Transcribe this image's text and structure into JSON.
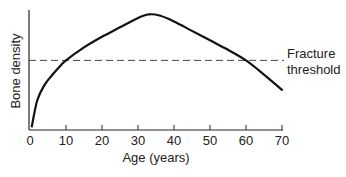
{
  "chart_data": {
    "type": "line",
    "title": "",
    "xlabel": "Age (years)",
    "ylabel": "Bone density",
    "xlim": [
      0,
      70
    ],
    "ylim": [
      0,
      100
    ],
    "x_ticks": [
      0,
      10,
      20,
      30,
      40,
      50,
      60,
      70
    ],
    "y_ticks": [],
    "grid": false,
    "series": [
      {
        "name": "Bone density",
        "x": [
          0.5,
          2,
          4,
          6,
          8,
          10,
          15,
          20,
          25,
          30,
          33,
          36,
          40,
          45,
          50,
          55,
          60,
          65,
          70
        ],
        "values": [
          3,
          25,
          38,
          46,
          53,
          59,
          70,
          79,
          87,
          95,
          98,
          97,
          92,
          84,
          76,
          68,
          59,
          47,
          34
        ]
      }
    ],
    "reference_lines": [
      {
        "name": "Fracture threshold",
        "y": 59,
        "style": "dashed"
      }
    ],
    "annotations": [
      {
        "text_line1": "Fracture",
        "text_line2": "threshold",
        "x": 70,
        "y": 59
      }
    ],
    "crossings": [
      10,
      60
    ]
  }
}
